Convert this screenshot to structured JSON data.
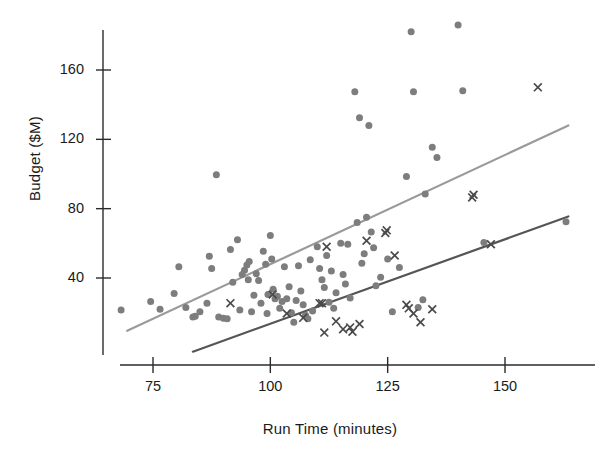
{
  "chart_data": {
    "type": "scatter",
    "title": "",
    "xlabel": "Run Time (minutes)",
    "ylabel": "Budget ($M)",
    "xlim": [
      66,
      168
    ],
    "ylim": [
      -5,
      195
    ],
    "xticks": [
      75,
      100,
      125,
      150
    ],
    "yticks": [
      40,
      80,
      120,
      160
    ],
    "grid": false,
    "legend": "none",
    "series": [
      {
        "name": "circles",
        "marker": "circle",
        "color": "#7d7d7d",
        "points": [
          [
            68.2,
            21.5
          ],
          [
            74.5,
            26.5
          ],
          [
            76.5,
            22.0
          ],
          [
            79.5,
            31.0
          ],
          [
            80.5,
            46.5
          ],
          [
            82.0,
            23.0
          ],
          [
            83.5,
            17.5
          ],
          [
            84.0,
            18.0
          ],
          [
            85.0,
            20.5
          ],
          [
            86.5,
            25.5
          ],
          [
            87.0,
            52.5
          ],
          [
            87.5,
            45.5
          ],
          [
            88.5,
            99.5
          ],
          [
            89.0,
            17.5
          ],
          [
            90.0,
            16.8
          ],
          [
            90.8,
            16.5
          ],
          [
            91.5,
            56.5
          ],
          [
            92.0,
            37.5
          ],
          [
            93.0,
            62.0
          ],
          [
            93.5,
            21.5
          ],
          [
            94.0,
            42.0
          ],
          [
            94.5,
            44.5
          ],
          [
            95.0,
            47.5
          ],
          [
            95.3,
            39.0
          ],
          [
            95.5,
            49.5
          ],
          [
            96.0,
            20.5
          ],
          [
            96.5,
            30.0
          ],
          [
            97.0,
            42.5
          ],
          [
            97.5,
            38.5
          ],
          [
            98.0,
            25.5
          ],
          [
            98.5,
            55.5
          ],
          [
            99.0,
            48.0
          ],
          [
            99.3,
            19.5
          ],
          [
            99.5,
            30.5
          ],
          [
            100.0,
            64.5
          ],
          [
            100.3,
            51.0
          ],
          [
            100.6,
            33.5
          ],
          [
            101.0,
            28.0
          ],
          [
            101.5,
            29.5
          ],
          [
            102.0,
            22.5
          ],
          [
            102.5,
            26.5
          ],
          [
            103.0,
            46.5
          ],
          [
            103.5,
            28.0
          ],
          [
            104.0,
            35.0
          ],
          [
            104.5,
            20.0
          ],
          [
            105.0,
            14.5
          ],
          [
            105.5,
            27.0
          ],
          [
            106.0,
            47.0
          ],
          [
            106.5,
            32.5
          ],
          [
            107.0,
            24.5
          ],
          [
            107.5,
            18.5
          ],
          [
            108.0,
            16.5
          ],
          [
            108.5,
            50.5
          ],
          [
            109.0,
            21.0
          ],
          [
            110.0,
            58.0
          ],
          [
            110.5,
            45.5
          ],
          [
            111.0,
            39.0
          ],
          [
            111.5,
            34.5
          ],
          [
            112.0,
            53.0
          ],
          [
            112.5,
            26.0
          ],
          [
            113.0,
            44.0
          ],
          [
            113.5,
            22.5
          ],
          [
            114.0,
            31.5
          ],
          [
            115.0,
            60.0
          ],
          [
            115.5,
            42.0
          ],
          [
            116.0,
            36.5
          ],
          [
            116.5,
            59.5
          ],
          [
            117.0,
            28.5
          ],
          [
            118.0,
            147.5
          ],
          [
            118.5,
            72.0
          ],
          [
            119.0,
            132.5
          ],
          [
            119.5,
            48.5
          ],
          [
            120.0,
            54.0
          ],
          [
            120.5,
            75.0
          ],
          [
            121.0,
            128.0
          ],
          [
            121.5,
            66.5
          ],
          [
            122.0,
            57.5
          ],
          [
            122.5,
            35.5
          ],
          [
            123.5,
            40.5
          ],
          [
            125.0,
            51.0
          ],
          [
            126.0,
            20.5
          ],
          [
            127.5,
            46.0
          ],
          [
            129.0,
            98.5
          ],
          [
            130.0,
            182.0
          ],
          [
            130.5,
            147.5
          ],
          [
            131.5,
            23.0
          ],
          [
            132.5,
            27.5
          ],
          [
            133.0,
            88.5
          ],
          [
            134.5,
            115.5
          ],
          [
            135.5,
            109.5
          ],
          [
            140.0,
            186.0
          ],
          [
            141.0,
            148.0
          ],
          [
            145.5,
            60.5
          ],
          [
            163.0,
            72.5
          ]
        ]
      },
      {
        "name": "crosses",
        "marker": "x",
        "color": "#4a4a4a",
        "points": [
          [
            91.5,
            25.5
          ],
          [
            100.5,
            30.5
          ],
          [
            103.5,
            19.5
          ],
          [
            107.0,
            17.0
          ],
          [
            110.5,
            25.5
          ],
          [
            111.0,
            25.5
          ],
          [
            111.5,
            8.5
          ],
          [
            112.0,
            58.0
          ],
          [
            114.0,
            15.0
          ],
          [
            115.5,
            10.5
          ],
          [
            117.0,
            11.5
          ],
          [
            117.5,
            9.0
          ],
          [
            119.0,
            13.5
          ],
          [
            120.5,
            61.5
          ],
          [
            124.5,
            66.0
          ],
          [
            124.8,
            67.5
          ],
          [
            126.5,
            53.0
          ],
          [
            129.0,
            24.5
          ],
          [
            129.5,
            22.5
          ],
          [
            130.5,
            19.5
          ],
          [
            132.0,
            14.5
          ],
          [
            134.5,
            22.0
          ],
          [
            143.0,
            86.5
          ],
          [
            143.3,
            88.0
          ],
          [
            147.0,
            59.5
          ],
          [
            157.0,
            150.0
          ]
        ]
      }
    ],
    "trendlines": [
      {
        "name": "circles-fit",
        "color": "#9a9a9a",
        "x_start": 69.5,
        "y_start": 9.5,
        "x_end": 163.5,
        "y_end": 128.0
      },
      {
        "name": "crosses-fit",
        "color": "#555555",
        "x_start": 83.5,
        "y_start": -2.5,
        "x_end": 163.5,
        "y_end": 75.5
      }
    ]
  },
  "axes": {
    "y_ticks": [
      "40",
      "80",
      "120",
      "160"
    ],
    "x_ticks": [
      "75",
      "100",
      "125",
      "150"
    ],
    "y_title": "Budget ($M)",
    "x_title": "Run Time (minutes)"
  }
}
